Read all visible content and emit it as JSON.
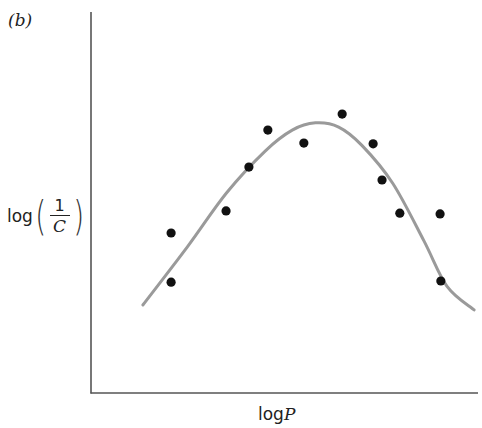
{
  "panel": {
    "label": "(b)"
  },
  "axes": {
    "ylabel_prefix": "log",
    "ylabel_numerator": "1",
    "ylabel_denominator": "C",
    "xlabel_prefix": "log",
    "xlabel_var": "P"
  },
  "colors": {
    "axis": "#555555",
    "curve": "#9a9a9a",
    "points": "#111111"
  },
  "chart_data": {
    "type": "scatter",
    "title": "",
    "panel_label": "(b)",
    "xlabel": "log P",
    "ylabel": "log(1/C)",
    "ticks": "none",
    "grid": false,
    "legend": null,
    "units": "arbitrary (pixel-normalized 0-100, origin at axis corner)",
    "xlim": [
      0,
      100
    ],
    "ylim": [
      0,
      100
    ],
    "series": [
      {
        "name": "observed",
        "kind": "scatter",
        "points": [
          {
            "x": 20.7,
            "y": 42.0
          },
          {
            "x": 20.7,
            "y": 29.1
          },
          {
            "x": 34.9,
            "y": 47.8
          },
          {
            "x": 40.8,
            "y": 59.3
          },
          {
            "x": 45.7,
            "y": 69.0
          },
          {
            "x": 55.0,
            "y": 65.6
          },
          {
            "x": 64.9,
            "y": 73.2
          },
          {
            "x": 72.9,
            "y": 65.4
          },
          {
            "x": 75.2,
            "y": 55.9
          },
          {
            "x": 79.8,
            "y": 47.2
          },
          {
            "x": 90.2,
            "y": 47.0
          },
          {
            "x": 90.4,
            "y": 29.4
          }
        ]
      },
      {
        "name": "parabolic fit",
        "kind": "line",
        "points": [
          {
            "x": 13.4,
            "y": 23.1
          },
          {
            "x": 25.0,
            "y": 38.5
          },
          {
            "x": 35.0,
            "y": 52.5
          },
          {
            "x": 45.0,
            "y": 63.5
          },
          {
            "x": 52.0,
            "y": 69.0
          },
          {
            "x": 58.0,
            "y": 70.9
          },
          {
            "x": 64.0,
            "y": 69.8
          },
          {
            "x": 70.0,
            "y": 65.0
          },
          {
            "x": 78.0,
            "y": 55.0
          },
          {
            "x": 86.0,
            "y": 40.0
          },
          {
            "x": 92.0,
            "y": 28.0
          },
          {
            "x": 99.0,
            "y": 21.8
          }
        ]
      }
    ]
  }
}
